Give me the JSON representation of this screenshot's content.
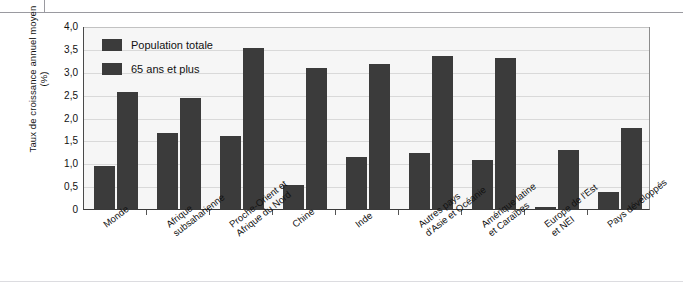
{
  "chart_data": {
    "type": "bar",
    "title": "",
    "subtitle": "",
    "xlabel": "",
    "ylabel": "Taux de croissance annuel moyen (%)",
    "ylim": [
      0,
      4.0
    ],
    "ytick_labels": [
      "4,0",
      "3,5",
      "3,0",
      "2,5",
      "2,0",
      "1,5",
      "1,0",
      "0,5",
      "0"
    ],
    "ytick_values": [
      4.0,
      3.5,
      3.0,
      2.5,
      2.0,
      1.5,
      1.0,
      0.5,
      0
    ],
    "grid": true,
    "legend_position": "top-left inside plot",
    "categories": [
      "Monde",
      "Afrique subsaharienne",
      "Proche-Orient et Afrique du Nord",
      "Chine",
      "Inde",
      "Autres pays d'Asie et Océanie",
      "Amérique latine et Caraïbes",
      "Europe de l'Est et NEI",
      "Pays développés"
    ],
    "category_label_lines": [
      [
        "Monde"
      ],
      [
        "Afrique",
        "subsaharienne"
      ],
      [
        "Proche-Orient et",
        "Afrique du Nord"
      ],
      [
        "Chine"
      ],
      [
        "Inde"
      ],
      [
        "Autres pays",
        "d'Asie et Océanie"
      ],
      [
        "Amérique latine",
        "et Caraïbes"
      ],
      [
        "Europe de l'Est",
        "et NEI"
      ],
      [
        "Pays développés"
      ]
    ],
    "series": [
      {
        "name": "Population totale",
        "color": "#3b3b3b",
        "values": [
          0.93,
          1.67,
          1.6,
          0.52,
          1.13,
          1.23,
          1.07,
          0.05,
          0.37
        ]
      },
      {
        "name": "65 ans et plus",
        "color": "#3b3b3b",
        "values": [
          2.55,
          2.42,
          3.52,
          3.08,
          3.17,
          3.35,
          3.3,
          1.28,
          1.78
        ]
      }
    ]
  },
  "legend": {
    "items": [
      {
        "label": "Population totale"
      },
      {
        "label": "65 ans et plus"
      }
    ]
  },
  "axis": {
    "y_title": "Taux de croissance annuel moyen (%)"
  },
  "colors": {
    "bar": "#3b3b3b",
    "plot_background": "#f6f6f6",
    "gridline": "#d9d9d9",
    "axis": "#3a3a3a",
    "page_rule": "#9a9aa0"
  }
}
